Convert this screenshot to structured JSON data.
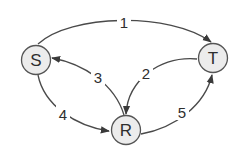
{
  "diagram": {
    "type": "directed-graph",
    "colors": {
      "node_fill": "#ececec",
      "node_stroke": "#555555",
      "edge": "#4a4a4a",
      "text": "#2e2e2e"
    },
    "nodes": [
      {
        "id": "S",
        "label": "S"
      },
      {
        "id": "T",
        "label": "T"
      },
      {
        "id": "R",
        "label": "R"
      }
    ],
    "edges": [
      {
        "id": "e1",
        "from": "S",
        "to": "T",
        "label": "1"
      },
      {
        "id": "e2",
        "from": "T",
        "to": "R",
        "label": "2"
      },
      {
        "id": "e3",
        "from": "R",
        "to": "S",
        "label": "3"
      },
      {
        "id": "e4",
        "from": "S",
        "to": "R",
        "label": "4"
      },
      {
        "id": "e5",
        "from": "R",
        "to": "T",
        "label": "5"
      }
    ]
  }
}
